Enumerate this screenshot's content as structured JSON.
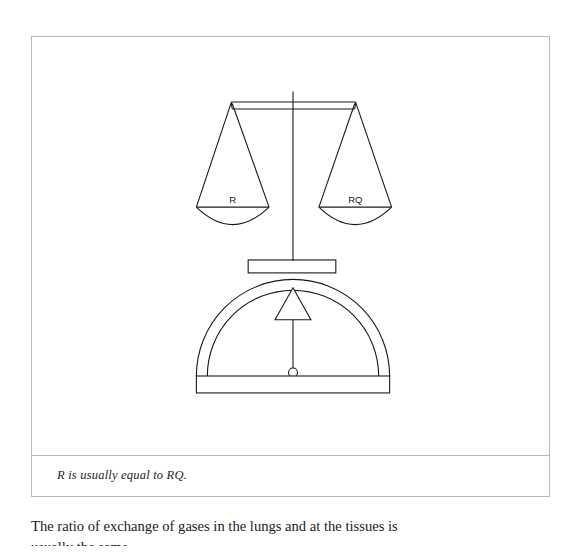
{
  "figure": {
    "caption": "R is usually equal to RQ.",
    "diagram": {
      "type": "balance-scale",
      "description": "Two-pan balance beam resting on a domed stand with a triangular pointer",
      "left_pan_label": "R",
      "right_pan_label": "RQ",
      "line_color": "#1a1a1a",
      "fill_color": "#ffffff",
      "border_color": "#b9b9b9"
    }
  },
  "body": {
    "line_1": "The ratio of exchange of gases in the lungs and at the tissues is",
    "line_2": "usually the same."
  }
}
